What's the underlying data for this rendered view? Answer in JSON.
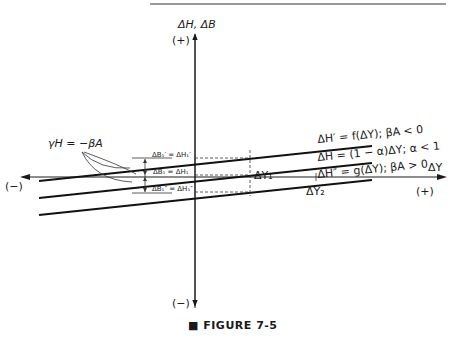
{
  "figure": {
    "caption": "FIGURE 7-5",
    "caption_marker": "■"
  },
  "axes": {
    "y_axis_label": "ΔH, ΔB",
    "y_plus": "(+)",
    "y_minus": "(−)",
    "x_axis_label": "ΔY",
    "x_plus": "(+)",
    "x_minus": "(−)"
  },
  "annotations": {
    "gamma": "γH = −βA",
    "delta_y1": "ΔY₁",
    "delta_y2": "ΔY₂",
    "b1_prime": "ΔB₁′ = ΔH₁′",
    "b1": "ΔB₁ = ΔH₁",
    "b1_double_prime": "ΔB₁″ = ΔH₁″"
  },
  "lines": [
    {
      "name": "upper",
      "label": "ΔH′ = f(ΔY); βA < 0"
    },
    {
      "name": "middle",
      "label": "ΔH = (1 − α)ΔY; α < 1"
    },
    {
      "name": "lower",
      "label": "ΔH″ = g(ΔY); βA > 0"
    }
  ],
  "colors": {
    "ink": "#1a1a1a",
    "background": "#ffffff"
  }
}
